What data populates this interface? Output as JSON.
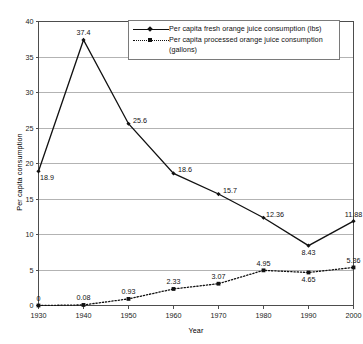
{
  "chart_data": {
    "type": "line",
    "title": "",
    "xlabel": "Year",
    "ylabel": "Per capita consumption",
    "x": [
      1930,
      1940,
      1950,
      1960,
      1970,
      1980,
      1990,
      2000
    ],
    "categories": [
      "1930",
      "1940",
      "1950",
      "1960",
      "1970",
      "1980",
      "1990",
      "2000"
    ],
    "xlim": [
      1930,
      2000
    ],
    "ylim": [
      0,
      40
    ],
    "yticks": [
      "0",
      "5",
      "10",
      "15",
      "20",
      "25",
      "30",
      "35",
      "40"
    ],
    "grid": "horizontal",
    "legend_position": "top-right-inside",
    "series": [
      {
        "name": "Per capita fresh orange juice consumption (lbs)",
        "style": "solid",
        "marker": "diamond",
        "values": [
          18.9,
          37.4,
          25.6,
          18.6,
          15.7,
          12.36,
          8.43,
          11.88
        ],
        "labels": [
          "18.9",
          "37.4",
          "25.6",
          "18.6",
          "15.7",
          "12.36",
          "8.43",
          "11.88"
        ],
        "label_positions": [
          "below-right",
          "above",
          "right",
          "right",
          "right",
          "right",
          "below",
          "above"
        ]
      },
      {
        "name": "Per capita processed orange juice consumption (gallons)",
        "style": "dotted",
        "marker": "square",
        "values": [
          0,
          0.08,
          0.93,
          2.33,
          3.07,
          4.95,
          4.65,
          5.36
        ],
        "labels": [
          "0",
          "0.08",
          "0.93",
          "2.33",
          "3.07",
          "4.95",
          "4.65",
          "5.36"
        ],
        "label_positions": [
          "above",
          "above",
          "above",
          "above",
          "above",
          "above",
          "below",
          "above"
        ]
      }
    ]
  },
  "legend": {
    "entries": [
      {
        "label": "Per capita fresh orange juice consumption (lbs)",
        "style": "solid",
        "marker": "diamond"
      },
      {
        "label": "Per capita processed orange juice consumption (gallons)",
        "style": "dotted",
        "marker": "square"
      }
    ]
  },
  "axes": {
    "y_title": "Per capita consumption",
    "x_title": "Year"
  }
}
